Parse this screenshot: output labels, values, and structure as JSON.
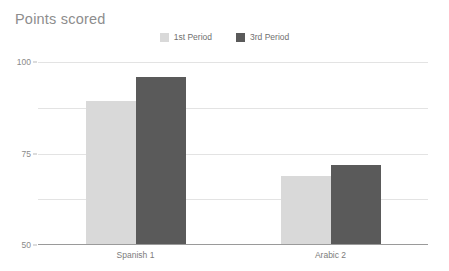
{
  "chart_data": {
    "type": "bar",
    "title": "Points scored",
    "xlabel": "",
    "ylabel": "",
    "categories": [
      "Spanish 1",
      "Arabic 2"
    ],
    "series": [
      {
        "name": "1st Period",
        "values": [
          78,
          37
        ],
        "color": "#d9d9d9"
      },
      {
        "name": "3rd Period",
        "values": [
          91,
          43
        ],
        "color": "#5a5a5a"
      }
    ],
    "ylim": [
      0,
      100
    ],
    "yticks": [
      0,
      25,
      50,
      75,
      100
    ],
    "ytick_labels": [
      "0",
      "25",
      "50",
      "75",
      "100"
    ],
    "grid": true,
    "legend_position": "top-center"
  },
  "colors": {
    "background": "#ffffff",
    "title_text": "#8d8d8d",
    "tick_text": "#8a8a8a",
    "category_text": "#7c7c7c",
    "legend_text": "#6f6f6f",
    "gridline": "#e3e3e3",
    "axis_line": "#9a9a9a",
    "series_1st_period": "#d9d9d9",
    "series_3rd_period": "#5a5a5a"
  }
}
